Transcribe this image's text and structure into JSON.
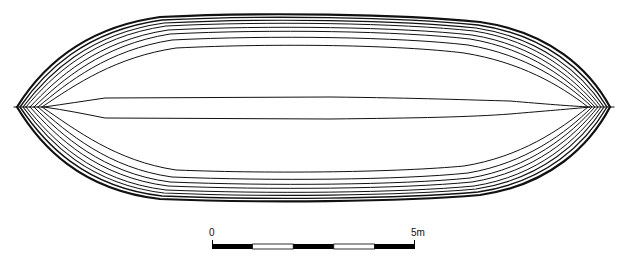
{
  "figure": {
    "hull_lines_count": 9,
    "stroke_color": "#111111",
    "background": "#ffffff"
  },
  "scale_bar": {
    "start_label": "0",
    "end_label": "5m",
    "segments": 5,
    "segment_colors": [
      "#000000",
      "#ffffff",
      "#000000",
      "#ffffff",
      "#000000"
    ]
  }
}
